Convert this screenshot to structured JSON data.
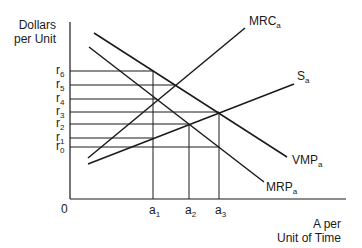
{
  "diagram": {
    "y_axis_label_line1": "Dollars",
    "y_axis_label_line2": "per Unit",
    "x_axis_label_line1": "A per",
    "x_axis_label_line2": "Unit of Time",
    "origin_label": "0",
    "curves": [
      {
        "id": "mrc",
        "label": "MRC",
        "subscript": "a",
        "x1": 88,
        "y1": 158,
        "x2": 245,
        "y2": 28,
        "label_x": 249,
        "label_y": 25
      },
      {
        "id": "s",
        "label": "S",
        "subscript": "a",
        "x1": 88,
        "y1": 164,
        "x2": 294,
        "y2": 84,
        "label_x": 297,
        "label_y": 80
      },
      {
        "id": "vmp",
        "label": "VMP",
        "subscript": "a",
        "x1": 94,
        "y1": 33,
        "x2": 287,
        "y2": 157,
        "label_x": 292,
        "label_y": 164
      },
      {
        "id": "mrp",
        "label": "MRP",
        "subscript": "a",
        "x1": 89,
        "y1": 47,
        "x2": 264,
        "y2": 182,
        "label_x": 266,
        "label_y": 191
      }
    ],
    "price_levels": [
      {
        "label": "r",
        "subscript": "6",
        "y": 71,
        "x_end": 153
      },
      {
        "label": "r",
        "subscript": "5",
        "y": 85,
        "x_end": 175
      },
      {
        "label": "r",
        "subscript": "4",
        "y": 99,
        "x_end": 157
      },
      {
        "label": "r",
        "subscript": "3",
        "y": 112,
        "x_end": 219
      },
      {
        "label": "r",
        "subscript": "2",
        "y": 124,
        "x_end": 189
      },
      {
        "label": "r",
        "subscript": "1",
        "y": 138,
        "x_end": 153
      },
      {
        "label": "r",
        "subscript": "0",
        "y": 147,
        "x_end": 219
      }
    ],
    "quantity_levels": [
      {
        "label": "a",
        "subscript": "1",
        "x": 153,
        "y_top": 71
      },
      {
        "label": "a",
        "subscript": "2",
        "x": 189,
        "y_top": 124
      },
      {
        "label": "a",
        "subscript": "3",
        "x": 219,
        "y_top": 112
      }
    ],
    "axes": {
      "origin_x": 70,
      "origin_y": 199,
      "y_top": 22,
      "x_right": 346
    }
  }
}
